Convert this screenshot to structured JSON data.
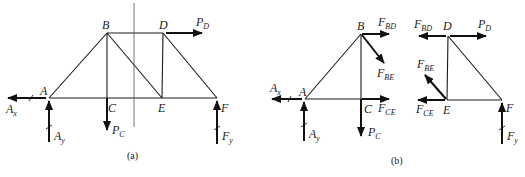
{
  "figure": {
    "panels": [
      {
        "id": "a",
        "caption": "(a)",
        "nodes": {
          "A": {
            "label": "A"
          },
          "B": {
            "label": "B"
          },
          "C": {
            "label": "C"
          },
          "D": {
            "label": "D"
          },
          "E": {
            "label": "E"
          },
          "F": {
            "label": "F"
          }
        },
        "members": [
          "AB",
          "AC",
          "CE",
          "EF",
          "BD",
          "BC",
          "BE",
          "DE",
          "DF"
        ],
        "section_cut": "vertical line cutting BD, BE, CE",
        "forces": {
          "Ax": {
            "main": "A",
            "sub": "x",
            "direction": "left",
            "reaction": true
          },
          "Ay": {
            "main": "A",
            "sub": "y",
            "direction": "up",
            "reaction": true
          },
          "PC": {
            "main": "P",
            "sub": "C",
            "direction": "down"
          },
          "PD": {
            "main": "P",
            "sub": "D",
            "direction": "right"
          },
          "Fy": {
            "main": "F",
            "sub": "y",
            "direction": "up",
            "reaction": true
          }
        }
      },
      {
        "id": "b",
        "caption": "(b)",
        "left_part": {
          "nodes": {
            "A": {
              "label": "A"
            },
            "B": {
              "label": "B"
            },
            "C": {
              "label": "C"
            }
          },
          "forces": {
            "Ax": {
              "main": "A",
              "sub": "x",
              "direction": "left"
            },
            "Ay": {
              "main": "A",
              "sub": "y",
              "direction": "up"
            },
            "PC": {
              "main": "P",
              "sub": "C",
              "direction": "down"
            },
            "FBD": {
              "main": "F",
              "sub": "BD",
              "direction": "right"
            },
            "FBE": {
              "main": "F",
              "sub": "BE",
              "direction": "down-right"
            },
            "FCE": {
              "main": "F",
              "sub": "CE",
              "direction": "right"
            }
          }
        },
        "right_part": {
          "nodes": {
            "D": {
              "label": "D"
            },
            "E": {
              "label": "E"
            },
            "F": {
              "label": "F"
            }
          },
          "forces": {
            "FBD": {
              "main": "F",
              "sub": "BD",
              "direction": "left"
            },
            "PD": {
              "main": "P",
              "sub": "D",
              "direction": "right"
            },
            "FBE": {
              "main": "F",
              "sub": "BE",
              "direction": "up-left"
            },
            "FCE": {
              "main": "F",
              "sub": "CE",
              "direction": "left"
            },
            "Fy": {
              "main": "F",
              "sub": "y",
              "direction": "up"
            }
          }
        }
      }
    ]
  }
}
